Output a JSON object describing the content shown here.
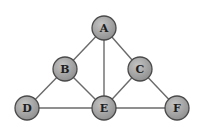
{
  "diagram": {
    "type": "undirected-graph",
    "style": {
      "node_fill": "#9a9a9a",
      "node_fill_highlight": "#c4c4c4",
      "node_stroke": "#4a4a4a",
      "edge_color": "#6a6a6a",
      "label_color": "#1e1e1e",
      "node_radius": 12
    },
    "nodes": [
      {
        "id": "A",
        "label": "A",
        "x": 104,
        "y": 28
      },
      {
        "id": "B",
        "label": "B",
        "x": 65,
        "y": 69
      },
      {
        "id": "C",
        "label": "C",
        "x": 140,
        "y": 69
      },
      {
        "id": "D",
        "label": "D",
        "x": 27,
        "y": 108
      },
      {
        "id": "E",
        "label": "E",
        "x": 104,
        "y": 108
      },
      {
        "id": "F",
        "label": "F",
        "x": 177,
        "y": 108
      }
    ],
    "edges": [
      {
        "from": "A",
        "to": "B"
      },
      {
        "from": "A",
        "to": "C"
      },
      {
        "from": "A",
        "to": "E"
      },
      {
        "from": "B",
        "to": "D"
      },
      {
        "from": "B",
        "to": "E"
      },
      {
        "from": "C",
        "to": "E"
      },
      {
        "from": "C",
        "to": "F"
      },
      {
        "from": "D",
        "to": "E"
      },
      {
        "from": "E",
        "to": "F"
      }
    ]
  }
}
